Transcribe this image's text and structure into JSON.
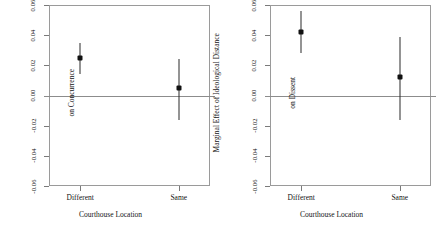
{
  "figure": {
    "width": 443,
    "height": 232,
    "background": "#ffffff",
    "axis_color": "#9a9a9a",
    "point_color": "#111111",
    "line_color": "#2b2b2b",
    "zero_line_color": "#8c8c8c"
  },
  "chart_data": [
    {
      "type": "scatter",
      "panel": "left",
      "title": "",
      "xlabel": "Courthouse Location",
      "ylabel": "Marginal Effect of Ideological Distance on Concurrence",
      "ylabel_lines": [
        "Marginal Effect of Ideological Distance",
        "on Concurrence"
      ],
      "categories": [
        "Different",
        "Same"
      ],
      "values": [
        0.025,
        0.005
      ],
      "ci_low": [
        0.014,
        -0.016
      ],
      "ci_high": [
        0.035,
        0.024
      ],
      "ylim": [
        -0.06,
        0.06
      ],
      "yticks": [
        0.06,
        0.04,
        0.02,
        0.0,
        -0.02,
        -0.04,
        -0.06
      ],
      "ytick_labels": [
        "0.06",
        "0.04",
        "0.02",
        "0.00",
        "-0.02",
        "-0.04",
        "-0.06"
      ],
      "grid": false,
      "zero_line": 0.0,
      "legend": "none"
    },
    {
      "type": "scatter",
      "panel": "right",
      "title": "",
      "xlabel": "Courthouse Location",
      "ylabel": "Marginal Effect of Ideological Distance on Dissent",
      "ylabel_lines": [
        "Marginal Effect of Ideological Distance",
        "on Dissent"
      ],
      "categories": [
        "Different",
        "Same"
      ],
      "values": [
        0.042,
        0.012
      ],
      "ci_low": [
        0.028,
        -0.016
      ],
      "ci_high": [
        0.056,
        0.039
      ],
      "ylim": [
        -0.06,
        0.06
      ],
      "yticks": [
        0.06,
        0.04,
        0.02,
        0.0,
        -0.02,
        -0.04,
        -0.06
      ],
      "ytick_labels": [
        "0.06",
        "0.04",
        "0.02",
        "0.00",
        "-0.02",
        "-0.04",
        "-0.06"
      ],
      "grid": false,
      "zero_line": 0.0,
      "legend": "none"
    }
  ]
}
